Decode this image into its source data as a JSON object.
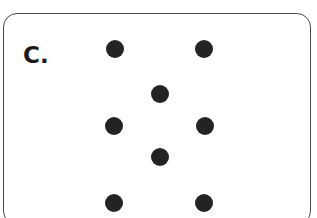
{
  "panel": {
    "label": "C.",
    "border_color": "#4a4a4e",
    "background_color": "#ffffff",
    "corner_radius_px": 14
  },
  "dots": {
    "color": "#232326",
    "count": 7,
    "diameter_px": 18,
    "items": [
      {
        "id": "dot-top-left",
        "cx": 114,
        "cy": 48,
        "r": 9
      },
      {
        "id": "dot-top-right",
        "cx": 203,
        "cy": 48,
        "r": 9
      },
      {
        "id": "dot-upper-center",
        "cx": 159,
        "cy": 93,
        "r": 9
      },
      {
        "id": "dot-middle-left",
        "cx": 113,
        "cy": 125,
        "r": 9
      },
      {
        "id": "dot-middle-right",
        "cx": 204,
        "cy": 125,
        "r": 9
      },
      {
        "id": "dot-lower-center",
        "cx": 159,
        "cy": 156,
        "r": 9
      },
      {
        "id": "dot-bottom-left",
        "cx": 113,
        "cy": 202,
        "r": 9
      },
      {
        "id": "dot-bottom-right",
        "cx": 203,
        "cy": 202,
        "r": 9
      }
    ]
  }
}
